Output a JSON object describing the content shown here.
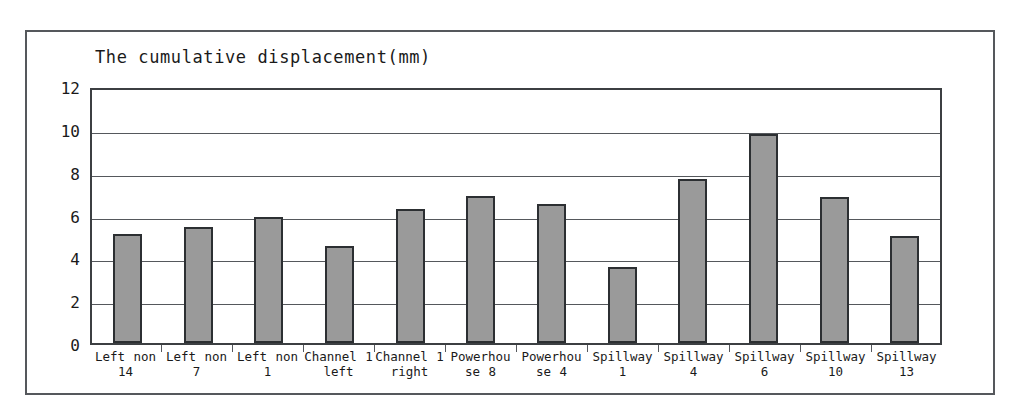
{
  "chart_data": {
    "type": "bar",
    "title": "The cumulative displacement(mm)",
    "xlabel": "",
    "ylabel": "",
    "ylim": [
      0,
      12
    ],
    "ytick_interval": 2,
    "ytick_labels": [
      "12",
      "10",
      "8",
      "6",
      "4",
      "2",
      "0"
    ],
    "ytick_values": [
      12,
      10,
      8,
      6,
      4,
      2,
      0
    ],
    "grid": true,
    "legend": false,
    "bar_color": "#9a9a9a",
    "bar_border_color": "#2c2f32",
    "frame_color": "#55585c",
    "categories": [
      "Left non 14",
      "Left non 7",
      "Left non 1",
      "Channel 1 left",
      "Channel 1 right",
      "Powerhouse 8",
      "Powerhouse 4",
      "Spillway 1",
      "Spillway 4",
      "Spillway 6",
      "Spillway 10",
      "Spillway 13"
    ],
    "category_lines": [
      [
        "Left non",
        "14"
      ],
      [
        "Left non",
        "7"
      ],
      [
        "Left non",
        "1"
      ],
      [
        "Channel 1",
        "left"
      ],
      [
        "Channel 1",
        "right"
      ],
      [
        "Powerhou",
        "se 8"
      ],
      [
        "Powerhou",
        "se 4"
      ],
      [
        "Spillway 1",
        ""
      ],
      [
        "Spillway 4",
        ""
      ],
      [
        "Spillway 6",
        ""
      ],
      [
        "Spillway 10",
        ""
      ],
      [
        "Spillway 13",
        ""
      ]
    ],
    "values": [
      5.1,
      5.4,
      5.9,
      4.55,
      6.25,
      6.85,
      6.5,
      3.55,
      7.65,
      9.75,
      6.8,
      5.0
    ]
  }
}
